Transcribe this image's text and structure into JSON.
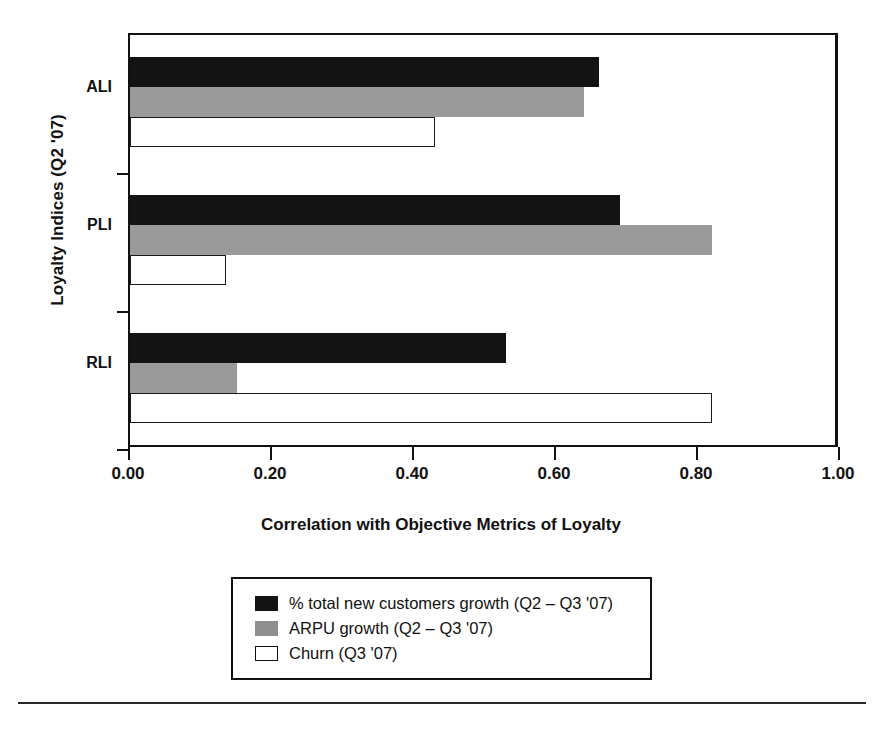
{
  "chart_data": {
    "type": "bar",
    "orientation": "horizontal",
    "title": "",
    "xlabel": "Correlation with Objective Metrics of Loyalty",
    "ylabel": "Loyalty Indices (Q2 '07)",
    "categories": [
      "ALI",
      "PLI",
      "RLI"
    ],
    "xlim": [
      0.0,
      1.0
    ],
    "xticks": [
      "0.00",
      "0.20",
      "0.40",
      "0.60",
      "0.80",
      "1.00"
    ],
    "xtick_values": [
      0.0,
      0.2,
      0.4,
      0.6,
      0.8,
      1.0
    ],
    "grid": false,
    "legend_position": "below-center",
    "series": [
      {
        "name": "% total new customers growth (Q2 – Q3 '07)",
        "fill": "black",
        "color": "#131313",
        "values": [
          0.66,
          0.69,
          0.53
        ]
      },
      {
        "name": "ARPU growth (Q2 – Q3 '07)",
        "fill": "gray",
        "color": "#9a9a9a",
        "values": [
          0.64,
          0.82,
          0.15
        ]
      },
      {
        "name": "Churn (Q3 '07)",
        "fill": "white",
        "color": "#ffffff",
        "values": [
          0.43,
          0.135,
          0.82
        ]
      }
    ]
  },
  "axis": {
    "y_title": "Loyalty Indices (Q2 '07)",
    "x_title": "Correlation with Objective Metrics of Loyalty",
    "categories": [
      {
        "label": "ALI"
      },
      {
        "label": "PLI"
      },
      {
        "label": "RLI"
      }
    ],
    "x_tick_labels": [
      "0.00",
      "0.20",
      "0.40",
      "0.60",
      "0.80",
      "1.00"
    ]
  },
  "legend": {
    "items": [
      {
        "label": "% total new customers growth (Q2 – Q3 '07)",
        "swatch": "black"
      },
      {
        "label": "ARPU growth (Q2 – Q3 '07)",
        "swatch": "gray"
      },
      {
        "label": "Churn (Q3 '07)",
        "swatch": "white"
      }
    ]
  },
  "footer": {
    "caption": ""
  }
}
